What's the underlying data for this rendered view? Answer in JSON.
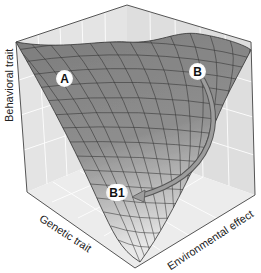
{
  "figure": {
    "type": "3d-surface-landscape",
    "axes": {
      "vertical_label": "Behavioral trait",
      "left_floor_label": "Genetic trait",
      "right_floor_label": "Environmental effect"
    },
    "markers": [
      {
        "id": "A",
        "label": "A"
      },
      {
        "id": "B",
        "label": "B"
      },
      {
        "id": "B1",
        "label": "B1"
      }
    ],
    "arrow": {
      "from": "B",
      "to": "B1"
    },
    "colors": {
      "surface": "#8a8a8a",
      "surface_light": "#d0d0d0",
      "mesh": "#2a2a2a",
      "wall": "#e6e6e6",
      "grid": "#ffffff",
      "arrow": "#9a9a9a"
    }
  }
}
